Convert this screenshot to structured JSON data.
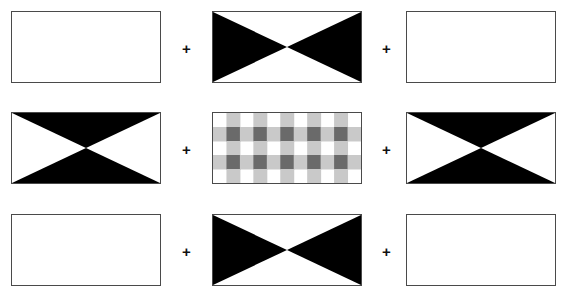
{
  "canvas": {
    "width": 573,
    "height": 297,
    "background": "#ffffff"
  },
  "style": {
    "border_color": "#4a4a4a",
    "pattern_black": "#000000",
    "pattern_white": "#ffffff",
    "gingham_light": "#c9c9c9",
    "gingham_dark": "#6a6a6a",
    "plus_color": "#111111"
  },
  "layout": {
    "rows": 3,
    "columns": 3,
    "patch_width": 150,
    "patch_height": 72,
    "column_x": [
      11,
      212,
      406
    ],
    "row_y": [
      11,
      112,
      214
    ]
  },
  "operators": [
    {
      "label": "+",
      "x": 182,
      "y": 41
    },
    {
      "label": "+",
      "x": 382,
      "y": 41
    },
    {
      "label": "+",
      "x": 182,
      "y": 142
    },
    {
      "label": "+",
      "x": 382,
      "y": 142
    },
    {
      "label": "+",
      "x": 182,
      "y": 244
    },
    {
      "label": "+",
      "x": 382,
      "y": 244
    }
  ],
  "patches": [
    {
      "id": "patch-r1c1",
      "name": "blank-patch-top-left",
      "row": 1,
      "column": 1,
      "pattern": "blank",
      "description": "empty white rectangle"
    },
    {
      "id": "patch-r1c2",
      "name": "bowtie-horizontal-patch-top-center",
      "row": 1,
      "column": 2,
      "pattern": "bowtie-horizontal",
      "description": "black triangles pointing inward from left and right edges"
    },
    {
      "id": "patch-r1c3",
      "name": "blank-patch-top-right",
      "row": 1,
      "column": 3,
      "pattern": "blank",
      "description": "empty white rectangle"
    },
    {
      "id": "patch-r2c1",
      "name": "bowtie-vertical-patch-middle-left",
      "row": 2,
      "column": 1,
      "pattern": "bowtie-vertical",
      "description": "black triangles pointing inward from top and bottom edges"
    },
    {
      "id": "patch-r2c2",
      "name": "gingham-patch-middle-center",
      "row": 2,
      "column": 2,
      "pattern": "gingham",
      "description": "grey and white gingham plaid check",
      "check_columns": 11,
      "check_rows": 5
    },
    {
      "id": "patch-r2c3",
      "name": "bowtie-vertical-patch-middle-right",
      "row": 2,
      "column": 3,
      "pattern": "bowtie-vertical",
      "description": "black triangles pointing inward from top and bottom edges"
    },
    {
      "id": "patch-r3c1",
      "name": "blank-patch-bottom-left",
      "row": 3,
      "column": 1,
      "pattern": "blank",
      "description": "empty white rectangle"
    },
    {
      "id": "patch-r3c2",
      "name": "bowtie-horizontal-patch-bottom-center",
      "row": 3,
      "column": 2,
      "pattern": "bowtie-horizontal",
      "description": "black triangles pointing inward from left and right edges"
    },
    {
      "id": "patch-r3c3",
      "name": "blank-patch-bottom-right",
      "row": 3,
      "column": 3,
      "pattern": "blank",
      "description": "empty white rectangle"
    }
  ]
}
